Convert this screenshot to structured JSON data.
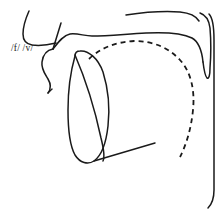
{
  "diagram": {
    "type": "sagittal-vocal-tract",
    "phoneme_label": "/f/ /v/",
    "label_position": {
      "x": 11,
      "y": 51
    },
    "stroke_color": "#1a1a1a",
    "background_color": "#ffffff",
    "parts": [
      {
        "name": "upper-lip",
        "label": "upper lip"
      },
      {
        "name": "upper-teeth",
        "label": "upper teeth"
      },
      {
        "name": "lower-lip",
        "label": "lower lip"
      },
      {
        "name": "chin",
        "label": "chin"
      },
      {
        "name": "hard-palate",
        "label": "hard palate"
      },
      {
        "name": "nasal-cavity-floor",
        "label": "nasal cavity floor"
      },
      {
        "name": "velum",
        "label": "velum"
      },
      {
        "name": "uvula",
        "label": "uvula"
      },
      {
        "name": "pharyngeal-wall",
        "label": "pharyngeal wall"
      },
      {
        "name": "tongue-body",
        "label": "tongue body"
      },
      {
        "name": "tongue-root",
        "label": "tongue root"
      },
      {
        "name": "lower-jaw",
        "label": "lower jaw"
      },
      {
        "name": "tongue-contour-dashed",
        "label": "tongue surface contour"
      }
    ]
  }
}
